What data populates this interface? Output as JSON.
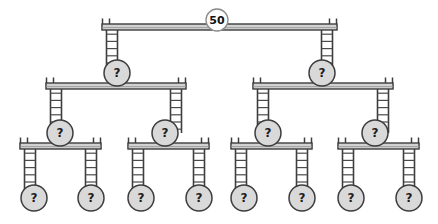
{
  "diagram": {
    "type": "binary-mobile-tree",
    "levels": 4,
    "unknown_symbol": "?",
    "colors": {
      "background": "#ffffff",
      "beam_fill": "#d2d2d2",
      "beam_stroke": "#3d3d3d",
      "node_fill": "#d9d9d9",
      "node_stroke": "#3d3d3d",
      "root_fill": "#fdfdfd",
      "root_stroke": "#8a8a8a",
      "text": "#1c1c1c",
      "rung_stroke": "#4a4a4a"
    },
    "root": {
      "id": "root",
      "label": "50",
      "name": "root-node-50",
      "cx": 217,
      "cy": 20,
      "r": 11,
      "style": "root"
    },
    "beams": [
      {
        "id": "beam-L1",
        "name": "beam-level-1",
        "x1": 102,
        "x2": 337,
        "y": 27,
        "thickness": 6
      },
      {
        "id": "beam-L2-a",
        "name": "beam-level-2-left",
        "x1": 46,
        "x2": 186,
        "y": 86,
        "thickness": 6
      },
      {
        "id": "beam-L2-b",
        "name": "beam-level-2-right",
        "x1": 253,
        "x2": 393,
        "y": 86,
        "thickness": 6
      },
      {
        "id": "beam-L3-a",
        "name": "beam-level-3-1",
        "x1": 20,
        "x2": 101,
        "y": 146,
        "thickness": 6
      },
      {
        "id": "beam-L3-b",
        "name": "beam-level-3-2",
        "x1": 128,
        "x2": 209,
        "y": 146,
        "thickness": 6
      },
      {
        "id": "beam-L3-c",
        "name": "beam-level-3-3",
        "x1": 231,
        "x2": 312,
        "y": 146,
        "thickness": 6
      },
      {
        "id": "beam-L3-d",
        "name": "beam-level-3-4",
        "x1": 338,
        "x2": 419,
        "y": 146,
        "thickness": 6
      }
    ],
    "hangers": [
      {
        "id": "h-1",
        "name": "hanger-root-to-n1",
        "x": 112,
        "y1": 27,
        "y2": 73,
        "width": 11
      },
      {
        "id": "h-2",
        "name": "hanger-root-to-n2",
        "x": 327,
        "y1": 27,
        "y2": 73,
        "width": 11
      },
      {
        "id": "h-3",
        "name": "hanger-n1-to-n3",
        "x": 56,
        "y1": 86,
        "y2": 133,
        "width": 11
      },
      {
        "id": "h-4",
        "name": "hanger-n1-to-n4",
        "x": 176,
        "y1": 86,
        "y2": 133,
        "width": 11
      },
      {
        "id": "h-5",
        "name": "hanger-n2-to-n5",
        "x": 263,
        "y1": 86,
        "y2": 133,
        "width": 11
      },
      {
        "id": "h-6",
        "name": "hanger-n2-to-n6",
        "x": 383,
        "y1": 86,
        "y2": 133,
        "width": 11
      },
      {
        "id": "h-7",
        "name": "hanger-n3-to-leaf1",
        "x": 30,
        "y1": 146,
        "y2": 190,
        "width": 11
      },
      {
        "id": "h-8",
        "name": "hanger-n3-to-leaf2",
        "x": 91,
        "y1": 146,
        "y2": 190,
        "width": 11
      },
      {
        "id": "h-9",
        "name": "hanger-n4-to-leaf3",
        "x": 138,
        "y1": 146,
        "y2": 190,
        "width": 11
      },
      {
        "id": "h-10",
        "name": "hanger-n4-to-leaf4",
        "x": 199,
        "y1": 146,
        "y2": 190,
        "width": 11
      },
      {
        "id": "h-11",
        "name": "hanger-n5-to-leaf5",
        "x": 241,
        "y1": 146,
        "y2": 190,
        "width": 11
      },
      {
        "id": "h-12",
        "name": "hanger-n5-to-leaf6",
        "x": 302,
        "y1": 146,
        "y2": 190,
        "width": 11
      },
      {
        "id": "h-13",
        "name": "hanger-n6-to-leaf7",
        "x": 348,
        "y1": 146,
        "y2": 190,
        "width": 11
      },
      {
        "id": "h-14",
        "name": "hanger-n6-to-leaf8",
        "x": 409,
        "y1": 146,
        "y2": 190,
        "width": 11
      }
    ],
    "nodes": [
      {
        "id": "n1",
        "name": "node-level2-left",
        "label": "?",
        "cx": 117,
        "cy": 73,
        "r": 13,
        "style": "internal"
      },
      {
        "id": "n2",
        "name": "node-level2-right",
        "label": "?",
        "cx": 322,
        "cy": 73,
        "r": 13,
        "style": "internal"
      },
      {
        "id": "n3",
        "name": "node-level3-1",
        "label": "?",
        "cx": 60,
        "cy": 133,
        "r": 13,
        "style": "internal"
      },
      {
        "id": "n4",
        "name": "node-level3-2",
        "label": "?",
        "cx": 165,
        "cy": 133,
        "r": 13,
        "style": "internal"
      },
      {
        "id": "n5",
        "name": "node-level3-3",
        "label": "?",
        "cx": 268,
        "cy": 133,
        "r": 13,
        "style": "internal"
      },
      {
        "id": "n6",
        "name": "node-level3-4",
        "label": "?",
        "cx": 375,
        "cy": 133,
        "r": 13,
        "style": "internal"
      },
      {
        "id": "leaf1",
        "name": "leaf-node-1",
        "label": "?",
        "cx": 34,
        "cy": 198,
        "r": 13,
        "style": "leaf"
      },
      {
        "id": "leaf2",
        "name": "leaf-node-2",
        "label": "?",
        "cx": 91,
        "cy": 198,
        "r": 13,
        "style": "leaf"
      },
      {
        "id": "leaf3",
        "name": "leaf-node-3",
        "label": "?",
        "cx": 141,
        "cy": 198,
        "r": 13,
        "style": "leaf"
      },
      {
        "id": "leaf4",
        "name": "leaf-node-4",
        "label": "?",
        "cx": 199,
        "cy": 198,
        "r": 13,
        "style": "leaf"
      },
      {
        "id": "leaf5",
        "name": "leaf-node-5",
        "label": "?",
        "cx": 244,
        "cy": 198,
        "r": 13,
        "style": "leaf"
      },
      {
        "id": "leaf6",
        "name": "leaf-node-6",
        "label": "?",
        "cx": 302,
        "cy": 198,
        "r": 13,
        "style": "leaf"
      },
      {
        "id": "leaf7",
        "name": "leaf-node-7",
        "label": "?",
        "cx": 351,
        "cy": 198,
        "r": 13,
        "style": "leaf"
      },
      {
        "id": "leaf8",
        "name": "leaf-node-8",
        "label": "?",
        "cx": 409,
        "cy": 198,
        "r": 13,
        "style": "leaf"
      }
    ]
  }
}
